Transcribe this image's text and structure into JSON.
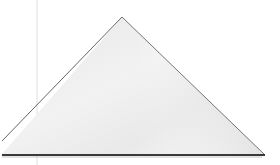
{
  "image": {
    "subject": "triangular folded paper on white surface",
    "background_color": "#ffffff",
    "paper_fill_light": "#f4f4f4",
    "paper_fill_dark": "#dcdcdc",
    "edge_color": "#555555",
    "base_shadow_color": "#3a3a3a",
    "crease_line_color": "#d8d8d8"
  }
}
